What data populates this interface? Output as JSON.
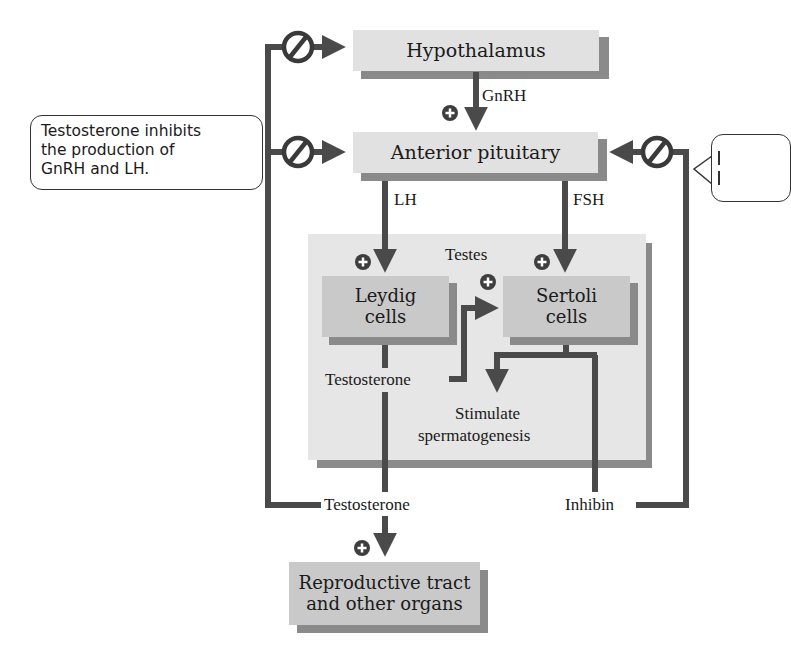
{
  "diagram": {
    "nodes": {
      "hypothalamus": "Hypothalamus",
      "anterior_pituitary": "Anterior pituitary",
      "testes": "Testes",
      "leydig_line1": "Leydig",
      "leydig_line2": "cells",
      "sertoli_line1": "Sertoli",
      "sertoli_line2": "cells",
      "stimulate_line1": "Stimulate",
      "stimulate_line2": "spermatogenesis",
      "reproductive_line1": "Reproductive tract",
      "reproductive_line2": "and other organs"
    },
    "edge_labels": {
      "gnrh": "GnRH",
      "lh": "LH",
      "fsh": "FSH",
      "testosterone_inner": "Testosterone",
      "testosterone_outer": "Testosterone",
      "inhibin": "Inhibin"
    },
    "signs": {
      "stimulate": "+",
      "inhibit": "⊘"
    },
    "callouts": {
      "left_line1": "Testosterone inhibits",
      "left_line2": "the production of",
      "left_line3": "GnRH and LH.",
      "right_partial": ""
    },
    "colors": {
      "arrow": "#4a4a4a",
      "box_light": "#e1e1e1",
      "box_mid": "#c9c9c9",
      "shadow": "#8a8a8a",
      "testes_bg": "#e6e6e6"
    }
  }
}
